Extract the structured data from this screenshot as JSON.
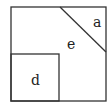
{
  "diagram": {
    "type": "geometry-figure",
    "stroke_color": "#333333",
    "background": "#ffffff",
    "shapes": {
      "outer_square": {
        "x": 11,
        "y": 7,
        "w": 95,
        "h": 94
      },
      "diagonal": {
        "x1": 60,
        "y1": 7,
        "x2": 106,
        "y2": 52
      },
      "inner_square": {
        "x": 11,
        "y": 54,
        "w": 48,
        "h": 47
      }
    },
    "labels": {
      "a": "a",
      "e": "e",
      "d": "d"
    }
  }
}
